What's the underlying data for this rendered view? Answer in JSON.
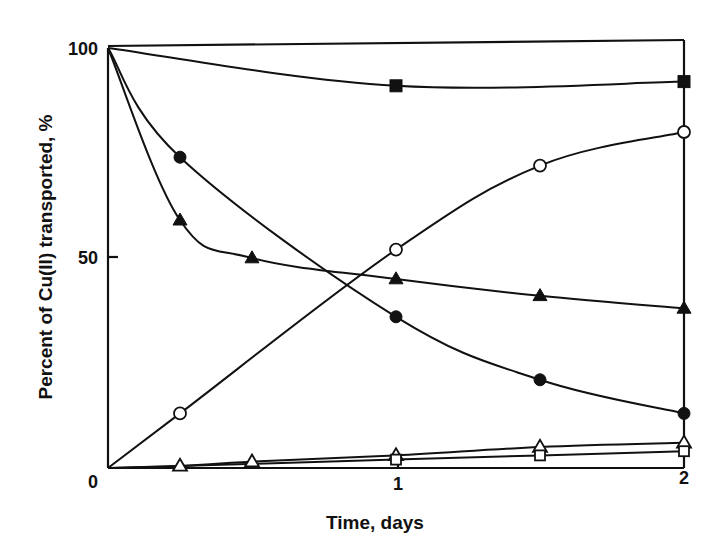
{
  "chart_data": {
    "type": "line",
    "title": "",
    "xlabel": "Time, days",
    "ylabel": "Percent of Cu(II) transported, %",
    "xlim": [
      0,
      2
    ],
    "ylim": [
      0,
      100
    ],
    "x_ticks": [
      "0",
      "1",
      "2"
    ],
    "y_ticks": [
      "0",
      "50",
      "100"
    ],
    "grid": false,
    "legend": "none",
    "series": [
      {
        "name": "filled-square",
        "marker": "square-filled",
        "x": [
          0,
          1,
          2
        ],
        "values": [
          100,
          91,
          92
        ]
      },
      {
        "name": "open-circle",
        "marker": "circle-open",
        "x": [
          0,
          0.25,
          1,
          1.5,
          2
        ],
        "values": [
          0,
          13,
          52,
          72,
          80
        ]
      },
      {
        "name": "filled-circle",
        "marker": "circle-filled",
        "x": [
          0,
          0.25,
          1,
          1.5,
          2
        ],
        "values": [
          100,
          74,
          36,
          21,
          13
        ]
      },
      {
        "name": "filled-triangle",
        "marker": "triangle-filled",
        "x": [
          0,
          0.25,
          0.5,
          1,
          1.5,
          2
        ],
        "values": [
          100,
          59,
          50,
          45,
          41,
          38
        ]
      },
      {
        "name": "open-triangle",
        "marker": "triangle-open",
        "x": [
          0,
          0.25,
          0.5,
          1,
          1.5,
          2
        ],
        "values": [
          0,
          0.5,
          1.5,
          3,
          5,
          6
        ]
      },
      {
        "name": "open-square",
        "marker": "square-open",
        "x": [
          0,
          1,
          1.5,
          2
        ],
        "values": [
          0,
          2,
          3,
          4
        ]
      }
    ]
  }
}
